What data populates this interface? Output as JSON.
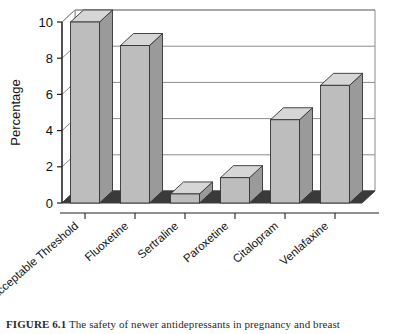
{
  "figure": {
    "caption_label": "FIGURE 6.1",
    "caption_text": "The safety of newer antidepressants in pregnancy and breast"
  },
  "chart_data": {
    "type": "bar",
    "title": "",
    "subtitle": "",
    "xlabel": "",
    "ylabel": "Percentage",
    "ylim": [
      0,
      10
    ],
    "yticks": [
      0,
      2,
      4,
      6,
      8,
      10
    ],
    "ytick_labels": [
      "0",
      "2",
      "4",
      "6",
      "8",
      "10"
    ],
    "grid": true,
    "grid_axis": "y",
    "legend": false,
    "legend_position": "none",
    "style": "3d-column",
    "categories": [
      "Acceptable Threshold",
      "Fluoxetine",
      "Sertraline",
      "Paroxetine",
      "Citalopram",
      "Venlafaxine"
    ],
    "values": [
      10.0,
      8.7,
      0.5,
      1.4,
      4.6,
      6.5
    ],
    "series": [
      {
        "name": "Percentage",
        "values": [
          10.0,
          8.7,
          0.5,
          1.4,
          4.6,
          6.5
        ]
      }
    ]
  },
  "colors": {
    "bar_face": "#bdbdbd",
    "bar_top": "#d6d6d6",
    "bar_side": "#9a9a9a",
    "bar_outline": "#333333",
    "floor": "#3a3a3a",
    "wall": "#ffffff",
    "gridline": "#8c8c8c",
    "axis": "#222222",
    "text": "#111111",
    "background": "#ffffff"
  }
}
